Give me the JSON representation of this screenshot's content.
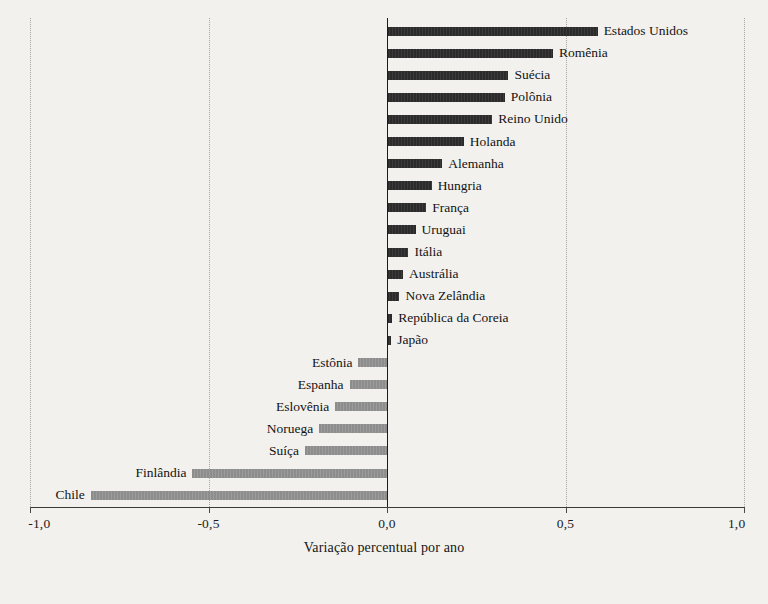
{
  "chart_data": {
    "type": "bar",
    "orientation": "horizontal",
    "title": "",
    "subtitle": "",
    "xlabel": "Variação percentual por ano",
    "ylabel": "",
    "xlim": [
      -1.0,
      1.0
    ],
    "grid": true,
    "legend": null,
    "tick_labels": [
      "-1,0",
      "-0,5",
      "0,0",
      "0,5",
      "1,0"
    ],
    "tick_values": [
      -1.0,
      -0.5,
      0.0,
      0.5,
      1.0
    ],
    "decimal_separator": ",",
    "colors": {
      "positive_bar": "#2b2b2b",
      "negative_bar": "#8d8d8d",
      "zero_line": "#1d1d1d",
      "grid_line": "#9a9a9a",
      "axis_line": "#3a3a3a",
      "background": "#f2f1ee",
      "text": "#131313"
    },
    "categories": [
      "Estados Unidos",
      "Romênia",
      "Suécia",
      "Polônia",
      "Reino Unido",
      "Holanda",
      "Alemanha",
      "Hungria",
      "França",
      "Uruguai",
      "Itália",
      "Austrália",
      "Nova Zelândia",
      "República da Coreia",
      "Japão",
      "Estônia",
      "Espanha",
      "Eslovênia",
      "Noruega",
      "Suíça",
      "Finlândia",
      "Chile"
    ],
    "values": [
      0.59,
      0.465,
      0.34,
      0.33,
      0.295,
      0.215,
      0.155,
      0.125,
      0.11,
      0.08,
      0.06,
      0.045,
      0.035,
      0.015,
      0.012,
      -0.08,
      -0.105,
      -0.145,
      -0.19,
      -0.23,
      -0.545,
      -0.83
    ]
  }
}
